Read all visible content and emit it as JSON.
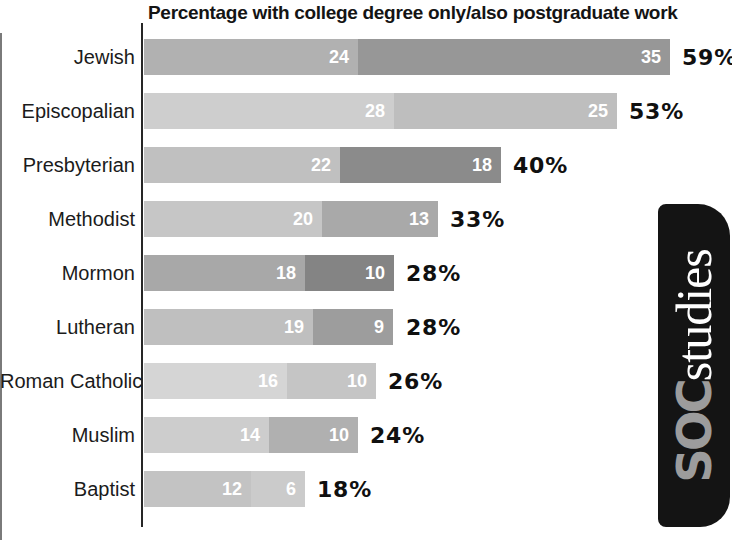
{
  "title": "Percentage with college degree only/also postgraduate work",
  "logo": {
    "soc": "SOC",
    "studies": "studies",
    "bg_color": "#141414",
    "soc_color": "#9c9c9c",
    "studies_color": "#ffffff"
  },
  "chart_data": {
    "type": "bar",
    "orientation": "horizontal",
    "stacked": true,
    "title": "Percentage with college degree only/also postgraduate work",
    "categories": [
      "Jewish",
      "Episcopalian",
      "Presbyterian",
      "Methodist",
      "Mormon",
      "Lutheran",
      "Roman Catholic",
      "Muslim",
      "Baptist"
    ],
    "series": [
      {
        "name": "College degree only",
        "values": [
          24,
          28,
          22,
          20,
          18,
          19,
          16,
          14,
          12
        ]
      },
      {
        "name": "Also postgraduate work",
        "values": [
          35,
          25,
          18,
          13,
          10,
          9,
          10,
          10,
          6
        ]
      }
    ],
    "totals": [
      59,
      53,
      40,
      33,
      28,
      28,
      26,
      24,
      18
    ],
    "value_suffix": "%",
    "xlim": [
      0,
      65
    ],
    "grid": false,
    "legend": "none",
    "value_labels": "inside-segment-end, white",
    "total_labels": "right-of-bar, black bold"
  },
  "rows": [
    {
      "label": "Jewish",
      "seg1": 24,
      "seg2": 35,
      "total": "59%",
      "color1": "#b1b1b1",
      "color2": "#979797"
    },
    {
      "label": "Episcopalian",
      "seg1": 28,
      "seg2": 25,
      "total": "53%",
      "color1": "#cecece",
      "color2": "#bebebe"
    },
    {
      "label": "Presbyterian",
      "seg1": 22,
      "seg2": 18,
      "total": "40%",
      "color1": "#c0c0c0",
      "color2": "#8b8b8b"
    },
    {
      "label": "Methodist",
      "seg1": 20,
      "seg2": 13,
      "total": "33%",
      "color1": "#c6c6c6",
      "color2": "#a9a9a9"
    },
    {
      "label": "Mormon",
      "seg1": 18,
      "seg2": 10,
      "total": "28%",
      "color1": "#a8a8a8",
      "color2": "#848484"
    },
    {
      "label": "Lutheran",
      "seg1": 19,
      "seg2": 9,
      "total": "28%",
      "color1": "#bfbfbf",
      "color2": "#9d9d9d"
    },
    {
      "label": "Roman Catholic",
      "seg1": 16,
      "seg2": 10,
      "total": "26%",
      "color1": "#d5d5d5",
      "color2": "#c5c5c5"
    },
    {
      "label": "Muslim",
      "seg1": 14,
      "seg2": 10,
      "total": "24%",
      "color1": "#cdcdcd",
      "color2": "#b0b0b0"
    },
    {
      "label": "Baptist",
      "seg1": 12,
      "seg2": 6,
      "total": "18%",
      "color1": "#c3c3c3",
      "color2": "#cbcbcb"
    }
  ]
}
